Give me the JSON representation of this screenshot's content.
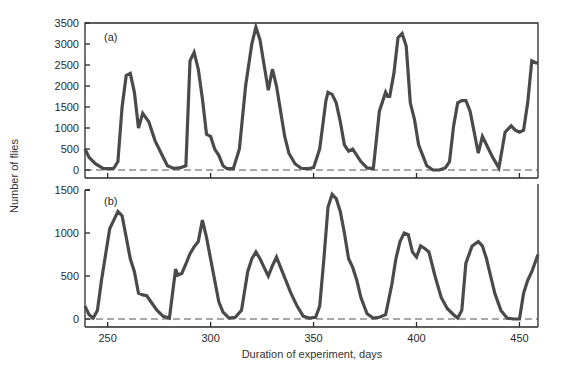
{
  "chart_data": [
    {
      "type": "line",
      "panel": "(a)",
      "ylabel": "Number of flies",
      "xlabel": "Duration of experiment, days",
      "ylim": [
        0,
        3500
      ],
      "xlim": [
        239,
        459
      ],
      "yticks": [
        0,
        500,
        1000,
        1500,
        2000,
        2500,
        3000,
        3500
      ],
      "grid": false,
      "baseline_dashed": true,
      "series": [
        {
          "name": "(a)",
          "x": [
            239,
            241,
            244,
            248,
            250,
            253,
            255,
            257,
            259,
            261,
            263,
            265,
            267,
            270,
            273,
            276,
            279,
            282,
            285,
            288,
            290,
            292,
            294,
            296,
            298,
            300,
            302,
            304,
            306,
            308,
            311,
            314,
            317,
            320,
            322,
            324,
            326,
            328,
            330,
            332,
            334,
            336,
            338,
            341,
            344,
            347,
            350,
            353,
            356,
            357,
            359,
            361,
            363,
            365,
            367,
            369,
            371,
            373,
            376,
            379,
            382,
            385,
            386,
            387,
            389,
            391,
            393,
            395,
            397,
            399,
            401,
            403,
            405,
            408,
            411,
            414,
            416,
            418,
            420,
            422,
            424,
            426,
            428,
            430,
            432,
            434,
            437,
            440,
            443,
            446,
            448,
            450,
            452,
            454,
            456,
            458,
            459
          ],
          "values": [
            500,
            300,
            150,
            30,
            30,
            40,
            200,
            1500,
            2250,
            2300,
            1850,
            1000,
            1350,
            1150,
            700,
            400,
            100,
            40,
            50,
            100,
            2600,
            2800,
            2400,
            1700,
            850,
            800,
            500,
            350,
            100,
            30,
            30,
            500,
            2000,
            3000,
            3400,
            3100,
            2500,
            1900,
            2400,
            2000,
            1400,
            800,
            400,
            150,
            40,
            30,
            60,
            500,
            1650,
            1850,
            1800,
            1600,
            1150,
            600,
            450,
            500,
            350,
            200,
            50,
            30,
            1400,
            1850,
            1750,
            1750,
            2300,
            3150,
            3250,
            2950,
            1600,
            1200,
            600,
            350,
            100,
            0,
            0,
            50,
            200,
            1050,
            1600,
            1650,
            1650,
            1400,
            900,
            400,
            800,
            600,
            300,
            50,
            900,
            1050,
            950,
            900,
            950,
            1600,
            2600,
            2550,
            2550
          ]
        }
      ]
    },
    {
      "type": "line",
      "panel": "(b)",
      "ylabel": "Number of flies",
      "xlabel": "Duration of experiment, days",
      "ylim": [
        0,
        1500
      ],
      "xlim": [
        239,
        459
      ],
      "yticks": [
        0,
        500,
        1000,
        1500
      ],
      "xticks": [
        250,
        300,
        350,
        400,
        450
      ],
      "grid": false,
      "baseline_dashed": true,
      "series": [
        {
          "name": "(b)",
          "x": [
            239,
            241,
            243,
            245,
            247,
            249,
            251,
            253,
            255,
            257,
            259,
            261,
            263,
            265,
            267,
            269,
            271,
            274,
            277,
            280,
            283,
            284,
            286,
            288,
            290,
            292,
            294,
            296,
            298,
            300,
            302,
            304,
            306,
            309,
            312,
            315,
            318,
            320,
            322,
            324,
            326,
            328,
            330,
            332,
            334,
            336,
            339,
            342,
            345,
            348,
            351,
            353,
            355,
            357,
            359,
            361,
            363,
            365,
            367,
            369,
            371,
            373,
            376,
            379,
            382,
            385,
            388,
            390,
            392,
            394,
            396,
            398,
            400,
            402,
            404,
            406,
            409,
            412,
            415,
            418,
            420,
            422,
            424,
            427,
            430,
            432,
            434,
            436,
            438,
            441,
            444,
            447,
            450,
            452,
            454,
            456,
            459
          ],
          "values": [
            150,
            50,
            10,
            100,
            450,
            750,
            1050,
            1150,
            1250,
            1200,
            950,
            700,
            550,
            300,
            280,
            270,
            200,
            100,
            30,
            10,
            580,
            510,
            530,
            640,
            760,
            840,
            900,
            1150,
            950,
            700,
            450,
            200,
            80,
            10,
            20,
            100,
            550,
            700,
            780,
            700,
            600,
            500,
            620,
            720,
            600,
            480,
            300,
            150,
            30,
            10,
            20,
            150,
            700,
            1300,
            1450,
            1400,
            1250,
            1000,
            700,
            600,
            450,
            250,
            60,
            10,
            20,
            50,
            400,
            700,
            900,
            1000,
            980,
            780,
            720,
            850,
            820,
            780,
            500,
            250,
            120,
            50,
            10,
            100,
            650,
            850,
            900,
            850,
            700,
            500,
            300,
            100,
            10,
            0,
            0,
            300,
            450,
            550,
            750
          ]
        }
      ]
    }
  ],
  "labels": {
    "panel_a": "(a)",
    "panel_b": "(b)",
    "ylabel": "Number of flies",
    "xlabel": "Duration of experiment, days"
  },
  "axis_a": {
    "ticks": [
      "0",
      "500",
      "1000",
      "1500",
      "2000",
      "2500",
      "3000",
      "3500"
    ]
  },
  "axis_b": {
    "ticks": [
      "0",
      "500",
      "1000",
      "1500"
    ]
  },
  "axis_x": {
    "ticks": [
      "250",
      "300",
      "350",
      "400",
      "450"
    ]
  },
  "colors": {
    "line": "#4a4a4a",
    "axis": "#2a2a2a",
    "baseline": "#555555"
  }
}
